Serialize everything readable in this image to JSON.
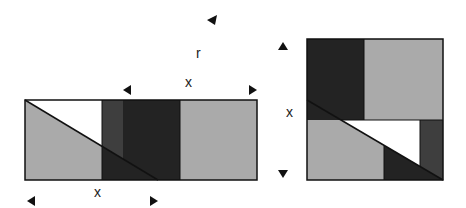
{
  "colors": {
    "light_grey": "#aaaaaa",
    "strip_dark": "#3e3e3e",
    "dark": "#232323",
    "white": "#ffffff",
    "stroke": "#111111"
  },
  "labels": {
    "r": "r",
    "top_x": "x",
    "bottom_x": "x",
    "side_x": "x"
  },
  "left_rectangle": {
    "x0": 25,
    "y0": 100,
    "x1": 257,
    "y1": 180,
    "dividers_x": [
      102,
      123,
      180
    ],
    "diagonal": {
      "from": [
        25,
        100
      ],
      "to": [
        158,
        180
      ]
    }
  },
  "right_square": {
    "x0": 307,
    "y0": 39,
    "x1": 443,
    "y1": 180,
    "divider_x": 364,
    "divider_y": 120,
    "diagonal": {
      "from": [
        307,
        100
      ],
      "to": [
        443,
        180
      ]
    },
    "strip_x": 420,
    "lower_divider_x": 384
  }
}
